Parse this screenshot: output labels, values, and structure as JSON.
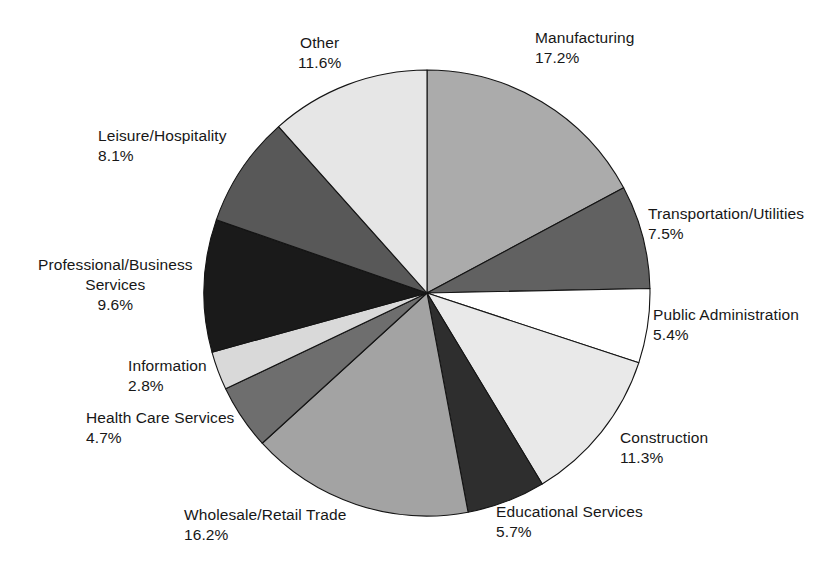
{
  "chart_data": {
    "type": "pie",
    "title": "",
    "subtitle": "",
    "xlabel": "",
    "ylabel": "",
    "legend_position": "none",
    "grid": false,
    "value_suffix": "%",
    "start_angle_deg": 0,
    "direction": "clockwise",
    "categories": [
      "Manufacturing",
      "Transportation/Utilities",
      "Public Administration",
      "Construction",
      "Educational Services",
      "Wholesale/Retail Trade",
      "Health Care Services",
      "Information",
      "Professional/Business Services",
      "Leisure/Hospitality",
      "Other"
    ],
    "values": [
      17.2,
      7.5,
      5.4,
      11.3,
      5.7,
      16.2,
      4.7,
      2.8,
      9.6,
      8.1,
      11.6
    ],
    "colors": [
      "#ababab",
      "#616161",
      "#ffffff",
      "#e9e9e9",
      "#2e2e2e",
      "#a3a3a3",
      "#6e6e6e",
      "#d9d9d9",
      "#1a1a1a",
      "#585858",
      "#e6e6e6"
    ],
    "slices": [
      {
        "label": "Manufacturing",
        "label_line2": "",
        "value": "17.2%",
        "color": "#ababab",
        "pct": 17.2
      },
      {
        "label": "Transportation/Utilities",
        "label_line2": "",
        "value": "7.5%",
        "color": "#616161",
        "pct": 7.5
      },
      {
        "label": "Public Administration",
        "label_line2": "",
        "value": "5.4%",
        "color": "#ffffff",
        "pct": 5.4
      },
      {
        "label": "Construction",
        "label_line2": "",
        "value": "11.3%",
        "color": "#e9e9e9",
        "pct": 11.3
      },
      {
        "label": "Educational Services",
        "label_line2": "",
        "value": "5.7%",
        "color": "#2e2e2e",
        "pct": 5.7
      },
      {
        "label": "Wholesale/Retail Trade",
        "label_line2": "",
        "value": "16.2%",
        "color": "#a3a3a3",
        "pct": 16.2
      },
      {
        "label": "Health Care Services",
        "label_line2": "",
        "value": "4.7%",
        "color": "#6e6e6e",
        "pct": 4.7
      },
      {
        "label": "Information",
        "label_line2": "",
        "value": "2.8%",
        "color": "#d9d9d9",
        "pct": 2.8
      },
      {
        "label": "Professional/Business",
        "label_line2": "Services",
        "value": "9.6%",
        "color": "#1a1a1a",
        "pct": 9.6
      },
      {
        "label": "Leisure/Hospitality",
        "label_line2": "",
        "value": "8.1%",
        "color": "#585858",
        "pct": 8.1
      },
      {
        "label": "Other",
        "label_line2": "",
        "value": "11.6%",
        "color": "#e6e6e6",
        "pct": 11.6
      }
    ]
  },
  "geometry": {
    "center_x": 427,
    "center_y": 293,
    "radius": 223
  },
  "label_positions": [
    {
      "x": 535,
      "y": 28,
      "align": "left",
      "anchor": "left"
    },
    {
      "x": 648,
      "y": 204,
      "align": "left",
      "anchor": "left"
    },
    {
      "x": 653,
      "y": 305,
      "align": "left",
      "anchor": "left"
    },
    {
      "x": 620,
      "y": 428,
      "align": "left",
      "anchor": "left"
    },
    {
      "x": 496,
      "y": 502,
      "align": "left",
      "anchor": "left"
    },
    {
      "x": 184,
      "y": 505,
      "align": "left",
      "anchor": "left"
    },
    {
      "x": 86,
      "y": 408,
      "align": "left",
      "anchor": "left"
    },
    {
      "x": 128,
      "y": 356,
      "align": "left",
      "anchor": "left"
    },
    {
      "x": 38,
      "y": 255,
      "align": "center",
      "anchor": "left"
    },
    {
      "x": 98,
      "y": 126,
      "align": "left",
      "anchor": "left"
    },
    {
      "x": 298,
      "y": 33,
      "align": "center",
      "anchor": "left"
    }
  ]
}
